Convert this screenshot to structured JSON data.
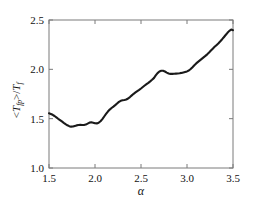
{
  "chart_data": {
    "type": "line",
    "title": "",
    "xlabel": "α",
    "ylabel": "<T_fp>/T_f",
    "ylabel_parts": {
      "open": "<",
      "symbol": "T",
      "symbol_sub": "fp",
      "close": ">/",
      "denom_symbol": "T",
      "denom_sub": "f"
    },
    "xlim": [
      1.5,
      3.5
    ],
    "ylim": [
      1.0,
      2.5
    ],
    "xticks": [
      1.5,
      2.0,
      2.5,
      3.0,
      3.5
    ],
    "xticklabels": [
      "1.5",
      "2.0",
      "2.5",
      "3.0",
      "3.5"
    ],
    "yticks": [
      1.0,
      1.5,
      2.0,
      2.5
    ],
    "yticklabels": [
      "1.0",
      "1.5",
      "2.0",
      "2.5"
    ],
    "grid": false,
    "legend": null,
    "series": [
      {
        "name": "mean-first-passage-ratio",
        "color": "#1a1a1a",
        "linewidth": 2.1,
        "x": [
          1.5,
          1.52,
          1.54,
          1.56,
          1.58,
          1.6,
          1.62,
          1.64,
          1.66,
          1.68,
          1.7,
          1.72,
          1.74,
          1.76,
          1.78,
          1.8,
          1.82,
          1.84,
          1.86,
          1.88,
          1.9,
          1.92,
          1.94,
          1.96,
          1.98,
          2.0,
          2.02,
          2.04,
          2.06,
          2.08,
          2.1,
          2.12,
          2.14,
          2.16,
          2.18,
          2.2,
          2.22,
          2.24,
          2.26,
          2.28,
          2.3,
          2.32,
          2.34,
          2.36,
          2.38,
          2.4,
          2.42,
          2.44,
          2.46,
          2.48,
          2.5,
          2.52,
          2.54,
          2.56,
          2.58,
          2.6,
          2.62,
          2.64,
          2.66,
          2.68,
          2.7,
          2.72,
          2.74,
          2.76,
          2.78,
          2.8,
          2.82,
          2.84,
          2.86,
          2.88,
          2.9,
          2.92,
          2.94,
          2.96,
          2.98,
          3.0,
          3.02,
          3.04,
          3.06,
          3.08,
          3.1,
          3.12,
          3.14,
          3.16,
          3.18,
          3.2,
          3.22,
          3.24,
          3.26,
          3.28,
          3.3,
          3.32,
          3.34,
          3.36,
          3.38,
          3.4,
          3.42,
          3.44,
          3.46,
          3.48,
          3.5
        ],
        "y": [
          1.555,
          1.548,
          1.539,
          1.527,
          1.513,
          1.499,
          1.486,
          1.472,
          1.458,
          1.445,
          1.433,
          1.424,
          1.419,
          1.42,
          1.426,
          1.432,
          1.436,
          1.437,
          1.436,
          1.436,
          1.44,
          1.45,
          1.46,
          1.463,
          1.459,
          1.453,
          1.452,
          1.459,
          1.474,
          1.496,
          1.522,
          1.548,
          1.572,
          1.592,
          1.608,
          1.622,
          1.637,
          1.654,
          1.67,
          1.681,
          1.687,
          1.69,
          1.694,
          1.704,
          1.719,
          1.736,
          1.752,
          1.766,
          1.779,
          1.792,
          1.806,
          1.821,
          1.836,
          1.85,
          1.863,
          1.878,
          1.894,
          1.911,
          1.938,
          1.962,
          1.978,
          1.985,
          1.985,
          1.978,
          1.967,
          1.958,
          1.954,
          1.954,
          1.955,
          1.957,
          1.958,
          1.96,
          1.964,
          1.969,
          1.974,
          1.979,
          1.988,
          2.003,
          2.022,
          2.042,
          2.06,
          2.076,
          2.091,
          2.106,
          2.121,
          2.136,
          2.152,
          2.17,
          2.19,
          2.209,
          2.228,
          2.245,
          2.262,
          2.282,
          2.303,
          2.325,
          2.348,
          2.37,
          2.39,
          2.403,
          2.397
        ]
      }
    ]
  },
  "axes": {
    "frame_color": "#7a7a7a",
    "tick_color": "#7a7a7a"
  }
}
